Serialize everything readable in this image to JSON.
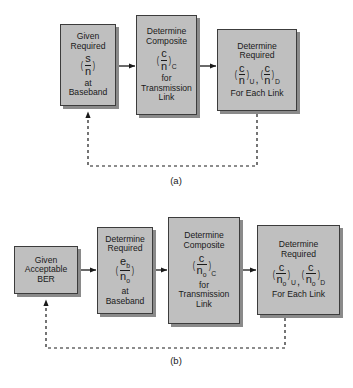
{
  "figure": {
    "type": "flow-diagram",
    "panels": [
      {
        "id": "a",
        "caption": "(a)",
        "boxes": [
          {
            "id": "a1",
            "lines_above": [
              "Given",
              "Required"
            ],
            "formula": {
              "numerator": "s",
              "denominator": "n",
              "subscript": ""
            },
            "lines_below": [
              "at",
              "Baseband"
            ]
          },
          {
            "id": "a2",
            "lines_above": [
              "Determine",
              "Composite"
            ],
            "formula": {
              "numerator": "c",
              "denominator": "n",
              "subscript": "C"
            },
            "lines_below": [
              "for",
              "Transmission",
              "Link"
            ]
          },
          {
            "id": "a3",
            "lines_above": [
              "Determine",
              "Required"
            ],
            "formula_pair": {
              "first": {
                "numerator": "c",
                "denominator": "n",
                "subscript": "U"
              },
              "separator": ",",
              "second": {
                "numerator": "c",
                "denominator": "n",
                "subscript": "D"
              }
            },
            "lines_below": [
              "For Each Link"
            ]
          }
        ],
        "connectors": [
          {
            "from": "a1",
            "to": "a2",
            "style": "solid-arrow"
          },
          {
            "from": "a2",
            "to": "a3",
            "style": "solid-arrow"
          },
          {
            "from": "a3",
            "to": "a1",
            "style": "dashed-feedback-arrow"
          }
        ]
      },
      {
        "id": "b",
        "caption": "(b)",
        "boxes": [
          {
            "id": "b1",
            "lines_above": [
              "Given",
              "Acceptable",
              "BER"
            ],
            "formula": null,
            "lines_below": []
          },
          {
            "id": "b2",
            "lines_above": [
              "Determine",
              "Required"
            ],
            "formula": {
              "numerator": "e",
              "numerator_sub": "b",
              "denominator": "n",
              "denominator_sub": "o",
              "subscript": ""
            },
            "lines_below": [
              "at",
              "Baseband"
            ]
          },
          {
            "id": "b3",
            "lines_above": [
              "Determine",
              "Composite"
            ],
            "formula": {
              "numerator": "c",
              "denominator": "n",
              "denominator_sub": "o",
              "subscript": "C"
            },
            "lines_below": [
              "for",
              "Transmission",
              "Link"
            ]
          },
          {
            "id": "b4",
            "lines_above": [
              "Determine",
              "Required"
            ],
            "formula_pair": {
              "first": {
                "numerator": "c",
                "denominator": "n",
                "denominator_sub": "o",
                "subscript": "U"
              },
              "separator": ",",
              "second": {
                "numerator": "c",
                "denominator": "n",
                "denominator_sub": "o",
                "subscript": "D"
              }
            },
            "lines_below": [
              "For Each Link"
            ]
          }
        ],
        "connectors": [
          {
            "from": "b1",
            "to": "b2",
            "style": "solid-arrow"
          },
          {
            "from": "b2",
            "to": "b3",
            "style": "solid-arrow"
          },
          {
            "from": "b3",
            "to": "b4",
            "style": "solid-arrow"
          },
          {
            "from": "b4",
            "to": "b1",
            "style": "dashed-feedback-arrow"
          }
        ]
      }
    ],
    "colors": {
      "box_fill": "#bfbfbf",
      "box_border": "#3c3c3c",
      "box_shadow": "#8a8a8a",
      "line": "#1a1a1a",
      "background": "#ffffff"
    },
    "paren_left": "(",
    "paren_right": ")"
  }
}
